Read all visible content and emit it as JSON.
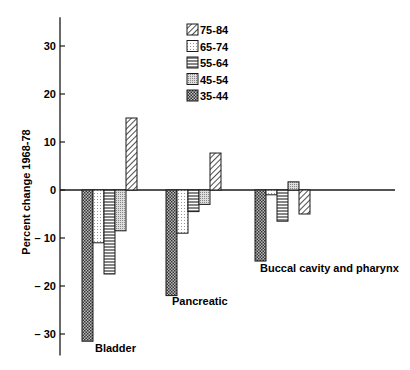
{
  "chart_data": {
    "type": "bar",
    "title": "",
    "xlabel": "",
    "ylabel": "Percent change 1968-78",
    "ylim": [
      -34,
      36
    ],
    "yticks": [
      30,
      20,
      10,
      0,
      -10,
      -20,
      -30
    ],
    "ytick_labels": [
      "30",
      "20",
      "10",
      "0",
      "– 10",
      "– 20",
      "– 30"
    ],
    "grid": false,
    "legend_position": "top-center",
    "categories": [
      "Bladder",
      "Pancreatic",
      "Buccal cavity and pharynx"
    ],
    "series_order_in_group": [
      "35-44",
      "65-74",
      "55-64",
      "45-54",
      "75-84"
    ],
    "series": [
      {
        "name": "35-44",
        "pattern": "crosshatch",
        "values": [
          -31.5,
          -22,
          -14.8
        ]
      },
      {
        "name": "65-74",
        "pattern": "light-dots",
        "values": [
          -11,
          -9,
          -1
        ]
      },
      {
        "name": "55-64",
        "pattern": "horizontal-lines",
        "values": [
          -17.5,
          -4.5,
          -6.5
        ]
      },
      {
        "name": "45-54",
        "pattern": "dense-dots",
        "values": [
          -8.5,
          -3,
          1.7
        ]
      },
      {
        "name": "75-84",
        "pattern": "diagonal-lines",
        "values": [
          15,
          7.7,
          -5
        ]
      }
    ],
    "legend": [
      "75-84",
      "65-74",
      "55-64",
      "45-54",
      "35-44"
    ]
  },
  "colors": {
    "ink": "#1a1a1a",
    "background": "#ffffff"
  }
}
